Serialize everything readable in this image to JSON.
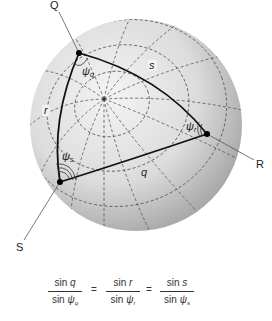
{
  "diagram": {
    "vertices": [
      {
        "id": "Q",
        "label": "Q",
        "x": 79,
        "y": 53
      },
      {
        "id": "R",
        "label": "R",
        "x": 207,
        "y": 134
      },
      {
        "id": "S",
        "label": "S",
        "x": 60,
        "y": 182
      }
    ],
    "sides": [
      {
        "id": "q",
        "label": "q",
        "between": [
          "R",
          "S"
        ]
      },
      {
        "id": "r",
        "label": "r",
        "between": [
          "Q",
          "S"
        ]
      },
      {
        "id": "s",
        "label": "s",
        "between": [
          "Q",
          "R"
        ]
      }
    ],
    "angles": [
      {
        "id": "psi_q",
        "symbol": "ψ",
        "sub": "q",
        "at": "Q"
      },
      {
        "id": "psi_r",
        "symbol": "ψ",
        "sub": "r",
        "at": "R"
      },
      {
        "id": "psi_s",
        "symbol": "ψ",
        "sub": "s",
        "at": "S"
      }
    ],
    "sphere": {
      "cx": 136,
      "cy": 125,
      "r": 106,
      "pole_x": 104,
      "pole_y": 99,
      "fill_light": "#f2f2f2",
      "fill_dark": "#9a9a9a",
      "grid_color": "#555555",
      "triangle_color": "#111111"
    }
  },
  "formula": {
    "terms": [
      {
        "num_fn": "sin",
        "num_var": "q",
        "den_fn": "sin",
        "den_sym": "ψ",
        "den_sub": "q"
      },
      {
        "num_fn": "sin",
        "num_var": "r",
        "den_fn": "sin",
        "den_sym": "ψ",
        "den_sub": "r"
      },
      {
        "num_fn": "sin",
        "num_var": "s",
        "den_fn": "sin",
        "den_sym": "ψ",
        "den_sub": "s"
      }
    ],
    "equals": "="
  }
}
